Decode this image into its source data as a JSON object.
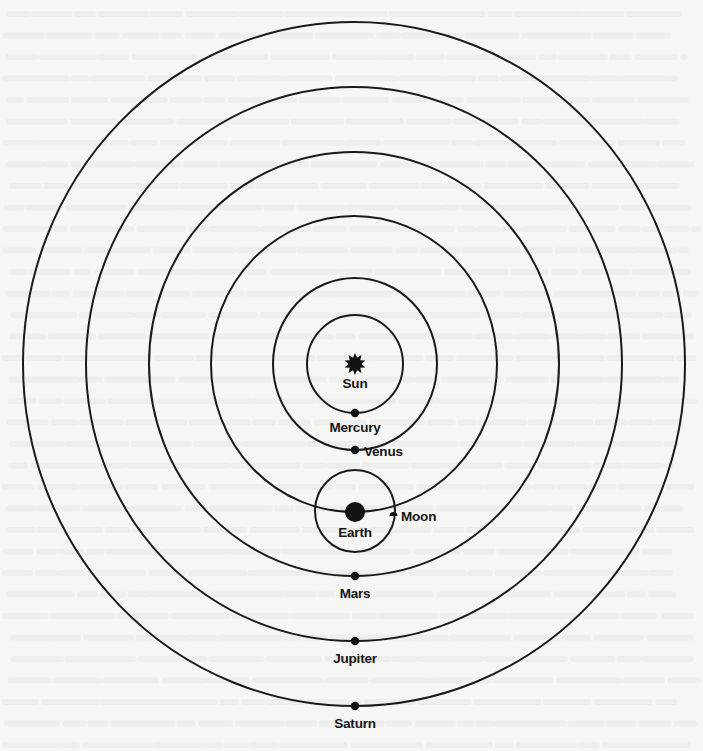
{
  "diagram": {
    "center_body": {
      "name": "Sun",
      "label": "Sun",
      "icon": "sun-star-icon"
    },
    "orbits": [
      {
        "name": "Mercury",
        "label": "Mercury",
        "order": 1,
        "label_position": "below"
      },
      {
        "name": "Venus",
        "label": "Venus",
        "order": 2,
        "label_position": "right"
      },
      {
        "name": "Earth",
        "label": "Earth",
        "order": 3,
        "label_position": "below",
        "has_satellite": true
      },
      {
        "name": "Mars",
        "label": "Mars",
        "order": 4,
        "label_position": "below"
      },
      {
        "name": "Jupiter",
        "label": "Jupiter",
        "order": 5,
        "label_position": "below"
      },
      {
        "name": "Saturn",
        "label": "Saturn",
        "order": 6,
        "label_position": "below"
      }
    ],
    "satellite": {
      "name": "Moon",
      "label": "Moon",
      "orbits": "Earth",
      "label_position": "right"
    },
    "colors": {
      "ink": "#151515",
      "paper": "#f6f6f5"
    }
  }
}
